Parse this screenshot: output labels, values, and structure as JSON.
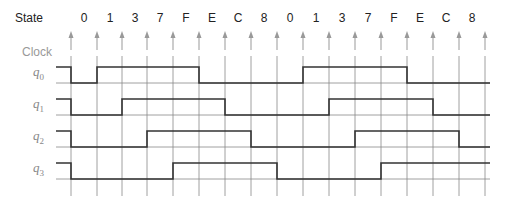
{
  "labels": {
    "state": "State",
    "clock": "Clock",
    "signals": [
      {
        "name": "q",
        "sub": "0"
      },
      {
        "name": "q",
        "sub": "1"
      },
      {
        "name": "q",
        "sub": "2"
      },
      {
        "name": "q",
        "sub": "3"
      }
    ]
  },
  "states": [
    "0",
    "1",
    "3",
    "7",
    "F",
    "E",
    "C",
    "8",
    "0",
    "1",
    "3",
    "7",
    "F",
    "E",
    "C",
    "8"
  ],
  "clock_edges_x": [
    71,
    97,
    122,
    147,
    173,
    199,
    225,
    251,
    277,
    303,
    329,
    355,
    381,
    407,
    433,
    459,
    485
  ],
  "waveforms": {
    "q0": [
      0,
      1,
      1,
      1,
      1,
      0,
      0,
      0,
      0,
      1,
      1,
      1,
      1,
      0,
      0,
      0
    ],
    "q1": [
      0,
      0,
      1,
      1,
      1,
      1,
      0,
      0,
      0,
      0,
      1,
      1,
      1,
      1,
      0,
      0
    ],
    "q2": [
      0,
      0,
      0,
      1,
      1,
      1,
      1,
      0,
      0,
      0,
      0,
      1,
      1,
      1,
      1,
      0
    ],
    "q3": [
      0,
      0,
      0,
      0,
      1,
      1,
      1,
      1,
      0,
      0,
      0,
      0,
      1,
      1,
      1,
      1
    ]
  },
  "initial_level": 1,
  "colors": {
    "wave": "#333333",
    "grid": "#888888",
    "arrow": "#999999",
    "label": "#888888"
  }
}
